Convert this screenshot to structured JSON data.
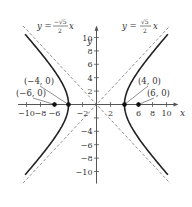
{
  "chart_data": {
    "type": "line",
    "title": "",
    "xlabel": "x",
    "ylabel": "y",
    "xlim": [
      -11,
      11
    ],
    "ylim": [
      -11.5,
      11.5
    ],
    "x_ticks": [
      -10,
      -8,
      -6,
      -4,
      -2,
      2,
      4,
      6,
      8,
      10
    ],
    "x_tick_labels": [
      "−10",
      "−8",
      "−6",
      "−2",
      "2",
      "6",
      "8",
      "10"
    ],
    "y_ticks": [
      10,
      8,
      6,
      4,
      2,
      -2,
      -4,
      -6,
      -8,
      -10
    ],
    "y_tick_labels": [
      "10",
      "8",
      "6",
      "4",
      "2",
      "−4",
      "−6",
      "−8",
      "−10"
    ],
    "grid": false,
    "series": [
      {
        "name": "hyperbola",
        "equation": "x^2/16 - y^2/20 = 1",
        "style": "solid",
        "branches": [
          "right",
          "left"
        ],
        "y_range": [
          -10.5,
          10.5
        ]
      },
      {
        "name": "asymptote-positive",
        "label": "y = (√5/2)x",
        "slope": 1.118,
        "style": "dashed"
      },
      {
        "name": "asymptote-negative",
        "label": "y = (−√5/2)x",
        "slope": -1.118,
        "style": "dashed"
      }
    ],
    "points": [
      {
        "label": "(−4, 0)",
        "x": -4,
        "y": 0
      },
      {
        "label": "(−6, 0)",
        "x": -6,
        "y": 0
      },
      {
        "label": "(4, 0)",
        "x": 4,
        "y": 0
      },
      {
        "label": "(6, 0)",
        "x": 6,
        "y": 0
      }
    ],
    "annotations": {
      "neg_asymptote": {
        "y": "y =",
        "num": "−√5",
        "den": "2",
        "x": "x"
      },
      "pos_asymptote": {
        "y": "y =",
        "num": "√5",
        "den": "2",
        "x": "x"
      }
    }
  },
  "colors": {
    "axis": "#555555",
    "curve": "#222222",
    "asymptote": "#888888",
    "text": "#333333"
  }
}
